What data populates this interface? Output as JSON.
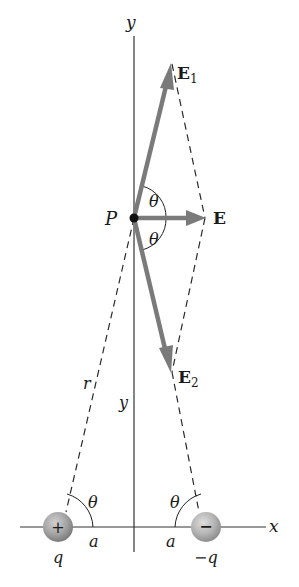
{
  "diagram": {
    "axes": {
      "x_label": "x",
      "y_label": "y"
    },
    "point": {
      "label": "P"
    },
    "vectors": {
      "E1": {
        "main": "E",
        "sub": "1"
      },
      "E2": {
        "main": "E",
        "sub": "2"
      },
      "E": {
        "main": "E"
      }
    },
    "angles": {
      "upper_at_P": "θ",
      "lower_at_P": "θ",
      "left_charge": "θ",
      "right_charge": "θ"
    },
    "distances": {
      "r": "r",
      "y": "y",
      "a_left": "a",
      "a_right": "a"
    },
    "charges": [
      {
        "symbol": "+",
        "label": "q"
      },
      {
        "symbol": "−",
        "label": "−q"
      }
    ],
    "colors": {
      "vector": "#7a7a7a",
      "axis": "#333333",
      "dashed": "#2a2a2a",
      "charge_fill": "#a8a8a8",
      "text": "#1a1a1a"
    }
  }
}
